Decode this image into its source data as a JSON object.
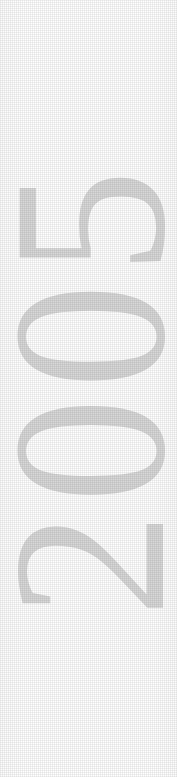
{
  "page": {
    "width": 177,
    "height": 777,
    "background_color": "#ffffff"
  },
  "year_label": {
    "text": "2005",
    "reading_direction": "bottom-to-top",
    "rotation_degrees": -90,
    "glyphs_top_to_bottom": [
      "5",
      "0",
      "0",
      "2"
    ],
    "ink_color": "#d8d8d8",
    "style": "serif-numerals-faint-halftone"
  }
}
